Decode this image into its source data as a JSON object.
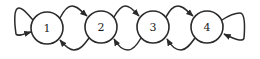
{
  "diagram": {
    "type": "state-transition",
    "nodes": [
      {
        "id": "1",
        "label": "1",
        "cx": 47,
        "cy": 28,
        "r": 16
      },
      {
        "id": "2",
        "label": "2",
        "cx": 101,
        "cy": 27,
        "r": 16
      },
      {
        "id": "3",
        "label": "3",
        "cx": 153,
        "cy": 27,
        "r": 16
      },
      {
        "id": "4",
        "label": "4",
        "cx": 207,
        "cy": 27,
        "r": 16
      }
    ],
    "edges": [
      {
        "from": "1",
        "to": "1",
        "kind": "self-loop"
      },
      {
        "from": "1",
        "to": "2",
        "kind": "forward"
      },
      {
        "from": "2",
        "to": "1",
        "kind": "backward"
      },
      {
        "from": "2",
        "to": "3",
        "kind": "forward"
      },
      {
        "from": "3",
        "to": "2",
        "kind": "backward"
      },
      {
        "from": "3",
        "to": "4",
        "kind": "forward"
      },
      {
        "from": "4",
        "to": "3",
        "kind": "backward"
      },
      {
        "from": "4",
        "to": "4",
        "kind": "self-loop"
      }
    ],
    "colors": {
      "stroke": "#2a2a2a",
      "fill": "#ffffff",
      "text": "#1a1a1a"
    }
  }
}
